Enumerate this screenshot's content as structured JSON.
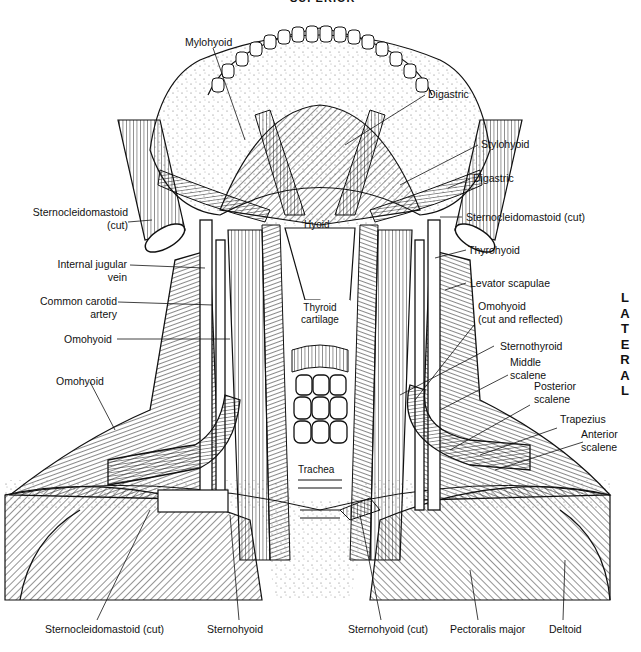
{
  "orientation": {
    "top": "SUPERIOR",
    "side": "LATERAL",
    "side_letters": [
      "L",
      "A",
      "T",
      "E",
      "R",
      "A",
      "L"
    ]
  },
  "labels": {
    "mylohyoid": "Mylohyoid",
    "digastric_top": "Digastric",
    "stylohyoid": "Stylohyoid",
    "digastric_right": "Digastric",
    "scm_cut_left_1": "Sternocleidomastoid",
    "scm_cut_left_2": "(cut)",
    "scm_cut_right": "Sternocleidomastoid (cut)",
    "hyoid": "Hyoid",
    "thyrohyoid": "Thyrohyoid",
    "internal_jugular_1": "Internal jugular",
    "internal_jugular_2": "vein",
    "levator_scapulae": "Levator scapulae",
    "common_carotid_1": "Common carotid",
    "common_carotid_2": "artery",
    "thyroid_cartilage_1": "Thyroid",
    "thyroid_cartilage_2": "cartilage",
    "omohyoid_reflected_1": "Omohyoid",
    "omohyoid_reflected_2": "(cut and reflected)",
    "omohyoid_mid": "Omohyoid",
    "sternothyroid": "Sternothyroid",
    "middle_scalene_1": "Middle",
    "middle_scalene_2": "scalene",
    "omohyoid_low": "Omohyoid",
    "posterior_scalene_1": "Posterior",
    "posterior_scalene_2": "scalene",
    "trapezius": "Trapezius",
    "anterior_scalene_1": "Anterior",
    "anterior_scalene_2": "scalene",
    "trachea": "Trachea",
    "scm_cut_bottom": "Sternocleidomastoid (cut)",
    "sternohyoid": "Sternohyoid",
    "sternohyoid_cut": "Sternohyoid (cut)",
    "pectoralis_major": "Pectoralis major",
    "deltoid": "Deltoid"
  },
  "colors": {
    "ink": "#111111",
    "paper": "#ffffff",
    "stipple": "#555555"
  }
}
